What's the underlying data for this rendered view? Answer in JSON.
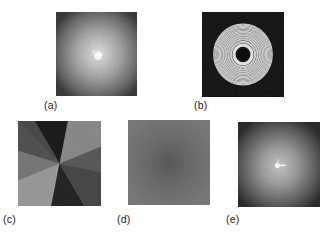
{
  "figure": {
    "panels": [
      {
        "id": "a",
        "label": "(a)",
        "content": "speckle intensity image, bright diffuse central spot fading to dark edges"
      },
      {
        "id": "b",
        "label": "(b)",
        "content": "concentric circular fringe pattern (rings) with dark center"
      },
      {
        "id": "c",
        "label": "(c)",
        "content": "phase map with angular sectors of differing gray levels around a central singularity"
      },
      {
        "id": "d",
        "label": "(d)",
        "content": "nearly uniform gray noisy image with slightly darker center"
      },
      {
        "id": "e",
        "label": "(e)",
        "content": "speckle intensity image with bright central point and short bright streak"
      }
    ]
  },
  "colors": {
    "background": "#ffffff",
    "label_text": "#222222"
  }
}
